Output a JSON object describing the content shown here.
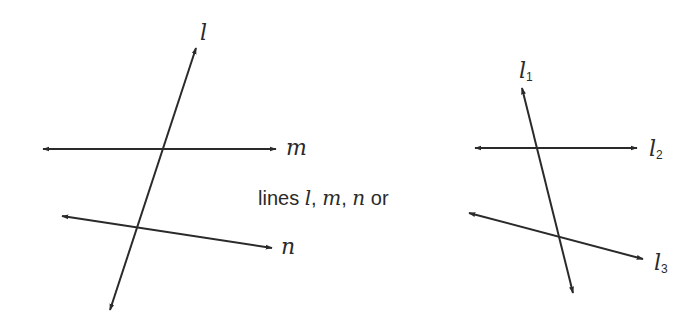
{
  "colors": {
    "line": "#2a2a2a",
    "background": "#ffffff"
  },
  "left_figure": {
    "labels": {
      "l": "l",
      "m": "m",
      "n": "n"
    }
  },
  "caption": {
    "prefix": "lines ",
    "v1": "l",
    "sep1": ", ",
    "v2": "m",
    "sep2": ", ",
    "v3": "n",
    "suffix": " or"
  },
  "right_figure": {
    "labels": {
      "l1_base": "l",
      "l1_sub": "1",
      "l2_base": "l",
      "l2_sub": "2",
      "l3_base": "l",
      "l3_sub": "3"
    }
  }
}
